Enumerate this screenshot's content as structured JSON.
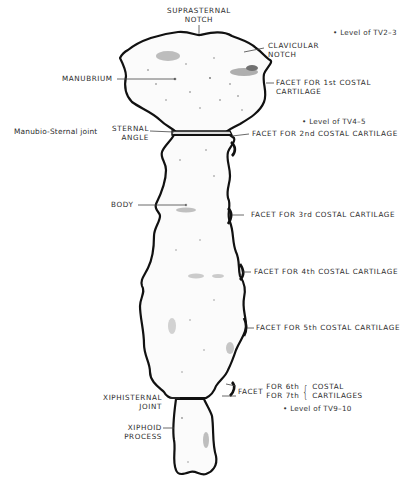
{
  "diagram": {
    "labels": {
      "suprasternal_notch": [
        "SUPRASTERNAL",
        "NOTCH"
      ],
      "clavicular_notch": [
        "CLAVICULAR",
        "NOTCH"
      ],
      "manubrium": "MANUBRIUM",
      "facet_1st": [
        "FACET FOR 1st COSTAL",
        "CARTILAGE"
      ],
      "manubrio_sternal_joint": "Manubio-Sternal joint",
      "sternal_angle": [
        "STERNAL",
        "ANGLE"
      ],
      "facet_2nd": "FACET FOR 2nd COSTAL CARTILAGE",
      "body": "BODY",
      "facet_3rd": "FACET FOR 3rd COSTAL CARTILAGE",
      "facet_4th": "FACET FOR 4th COSTAL CARTILAGE",
      "facet_5th": "FACET FOR 5th COSTAL CARTILAGE",
      "facet_6_7": {
        "prefix": "FACET",
        "lines": [
          "FOR 6th",
          "FOR 7th"
        ],
        "suffix": [
          "COSTAL",
          "CARTILAGES"
        ]
      },
      "xiphisternal_joint": [
        "XIPHISTERNAL",
        "JOINT"
      ],
      "xiphoid_process": [
        "XIPHOID",
        "PROCESS"
      ]
    },
    "vertebral_levels": [
      {
        "marker": "•",
        "text": "Level of TV2–3"
      },
      {
        "marker": "•",
        "text": "Level of TV4–5"
      },
      {
        "marker": "•",
        "text": "Level of TV9–10"
      }
    ],
    "colors": {
      "outline": "#111111",
      "shading": "#555555",
      "leader": "#444444",
      "text": "#2b2b2b"
    }
  }
}
